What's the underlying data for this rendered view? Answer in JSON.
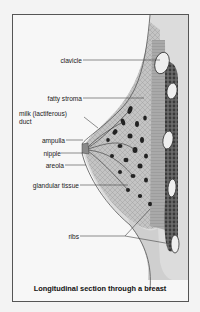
{
  "figure": {
    "caption": "Longitudinal section through a breast",
    "labels": [
      {
        "id": "clavicle",
        "text": "clavicle"
      },
      {
        "id": "fatty-stroma",
        "text": "fatty stroma"
      },
      {
        "id": "milk-duct",
        "text": "milk (lactiferous)\nduct",
        "line1": "milk (lactiferous)",
        "line2": "duct"
      },
      {
        "id": "ampulla",
        "text": "ampulla"
      },
      {
        "id": "nipple",
        "text": "nipple"
      },
      {
        "id": "areola",
        "text": "areola"
      },
      {
        "id": "glandular-tissue",
        "text": "glandular tissue"
      },
      {
        "id": "ribs",
        "text": "ribs"
      }
    ],
    "colors": {
      "frame": "#555555",
      "background": "#f7f7f7",
      "skin": "#d8d8d8",
      "tissue": "#b9b9b9",
      "muscle": "#5a5a5a",
      "lobules": "#222222",
      "rib": "#eeeeee",
      "leader": "#444444"
    }
  }
}
